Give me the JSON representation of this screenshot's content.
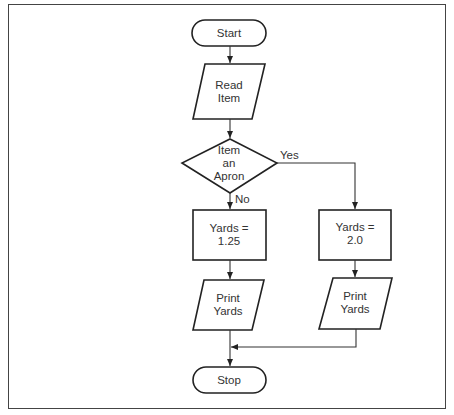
{
  "diagram": {
    "type": "flowchart",
    "nodes": [
      {
        "id": "start",
        "shape": "terminal",
        "label": "Start"
      },
      {
        "id": "read",
        "shape": "parallelogram",
        "label": "Read\nItem"
      },
      {
        "id": "decision",
        "shape": "diamond",
        "label": "Item\nan\nApron"
      },
      {
        "id": "yards_no",
        "shape": "rectangle",
        "label": "Yards =\n1.25"
      },
      {
        "id": "yards_yes",
        "shape": "rectangle",
        "label": "Yards =\n2.0"
      },
      {
        "id": "print_no",
        "shape": "parallelogram",
        "label": "Print\nYards"
      },
      {
        "id": "print_yes",
        "shape": "parallelogram",
        "label": "Print\nYards"
      },
      {
        "id": "stop",
        "shape": "terminal",
        "label": "Stop"
      }
    ],
    "edges": [
      {
        "from": "start",
        "to": "read",
        "label": ""
      },
      {
        "from": "read",
        "to": "decision",
        "label": ""
      },
      {
        "from": "decision",
        "to": "yards_yes",
        "label": "Yes"
      },
      {
        "from": "decision",
        "to": "yards_no",
        "label": "No"
      },
      {
        "from": "yards_no",
        "to": "print_no",
        "label": ""
      },
      {
        "from": "yards_yes",
        "to": "print_yes",
        "label": ""
      },
      {
        "from": "print_no",
        "to": "stop",
        "label": ""
      },
      {
        "from": "print_yes",
        "to": "stop",
        "label": ""
      }
    ],
    "edge_labels": {
      "yes": "Yes",
      "no": "No"
    },
    "colors": {
      "stroke": "#222222",
      "text": "#333333",
      "frame": "#444444",
      "background": "#ffffff"
    }
  }
}
